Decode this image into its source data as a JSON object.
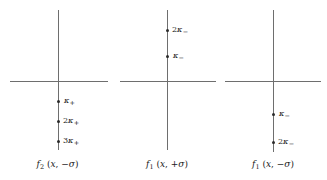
{
  "figure": {
    "type": "diagram",
    "background_color": "#ffffff",
    "axis_color": "#6e6e6e",
    "dot_color": "#2b2b2b",
    "text_color": "#1a1a1a"
  },
  "panels": [
    {
      "id": "panel-1",
      "caption": {
        "function": "f",
        "subscript": "2",
        "arguments": "(x, −σ)",
        "full": "f₂ (x, −σ)",
        "sign": "−",
        "sigma": "σ",
        "variable": "x"
      },
      "points": [
        {
          "label": "κ₊",
          "coefficient": "",
          "symbol": "κ",
          "subscript": "+",
          "side": "below"
        },
        {
          "label": "2κ₊",
          "coefficient": "2",
          "symbol": "κ",
          "subscript": "+",
          "side": "below"
        },
        {
          "label": "3κ₊",
          "coefficient": "3",
          "symbol": "κ",
          "subscript": "+",
          "side": "below"
        }
      ]
    },
    {
      "id": "panel-2",
      "caption": {
        "function": "f",
        "subscript": "1",
        "arguments": "(x, +σ)",
        "full": "f₁ (x, +σ)",
        "sign": "+",
        "sigma": "σ",
        "variable": "x"
      },
      "points": [
        {
          "label": "2κ₋",
          "coefficient": "2",
          "symbol": "κ",
          "subscript": "−",
          "side": "above"
        },
        {
          "label": "κ₋",
          "coefficient": "",
          "symbol": "κ",
          "subscript": "−",
          "side": "above"
        }
      ]
    },
    {
      "id": "panel-3",
      "caption": {
        "function": "f",
        "subscript": "1",
        "arguments": "(x, −σ)",
        "full": "f₁ (x, −σ)",
        "sign": "−",
        "sigma": "σ",
        "variable": "x"
      },
      "points": [
        {
          "label": "κ₋",
          "coefficient": "",
          "symbol": "κ",
          "subscript": "−",
          "side": "below"
        },
        {
          "label": "2κ₋",
          "coefficient": "2",
          "symbol": "κ",
          "subscript": "−",
          "side": "below"
        }
      ]
    }
  ]
}
